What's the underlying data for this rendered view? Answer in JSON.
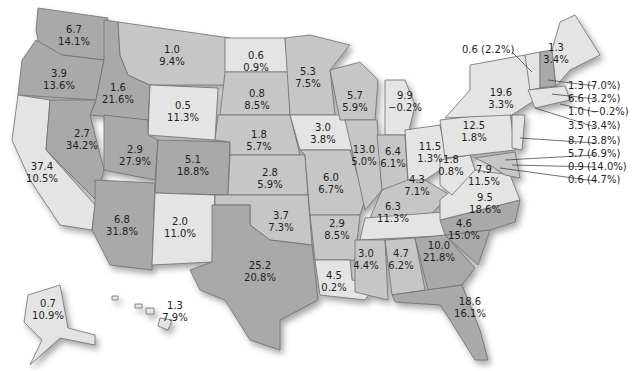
{
  "map": {
    "type": "choropleth",
    "region": "United States",
    "shading_levels": {
      "light": "#e4e4e4",
      "medium": "#c6c6c6",
      "dark": "#a9a9a9"
    },
    "label_format": "value / percent change",
    "states": {
      "WA": {
        "value": "6.7",
        "pct": "14.1%",
        "shade": "dark"
      },
      "OR": {
        "value": "3.9",
        "pct": "13.6%",
        "shade": "dark"
      },
      "CA": {
        "value": "37.4",
        "pct": "10.5%",
        "shade": "light"
      },
      "ID": {
        "value": "1.6",
        "pct": "21.6%",
        "shade": "dark"
      },
      "NV": {
        "value": "2.7",
        "pct": "34.2%",
        "shade": "dark"
      },
      "MT": {
        "value": "1.0",
        "pct": "9.4%",
        "shade": "mid"
      },
      "WY": {
        "value": "0.5",
        "pct": "11.3%",
        "shade": "light"
      },
      "UT": {
        "value": "2.9",
        "pct": "27.9%",
        "shade": "dark"
      },
      "AZ": {
        "value": "6.8",
        "pct": "31.8%",
        "shade": "dark"
      },
      "CO": {
        "value": "5.1",
        "pct": "18.8%",
        "shade": "dark"
      },
      "NM": {
        "value": "2.0",
        "pct": "11.0%",
        "shade": "light"
      },
      "ND": {
        "value": "0.6",
        "pct": "0.9%",
        "shade": "light"
      },
      "SD": {
        "value": "0.8",
        "pct": "8.5%",
        "shade": "mid"
      },
      "NE": {
        "value": "1.8",
        "pct": "5.7%",
        "shade": "mid"
      },
      "KS": {
        "value": "2.8",
        "pct": "5.9%",
        "shade": "mid"
      },
      "OK": {
        "value": "3.7",
        "pct": "7.3%",
        "shade": "mid"
      },
      "TX": {
        "value": "25.2",
        "pct": "20.8%",
        "shade": "dark"
      },
      "MN": {
        "value": "5.3",
        "pct": "7.5%",
        "shade": "mid"
      },
      "IA": {
        "value": "3.0",
        "pct": "3.8%",
        "shade": "light"
      },
      "MO": {
        "value": "6.0",
        "pct": "6.7%",
        "shade": "mid"
      },
      "AR": {
        "value": "2.9",
        "pct": "8.5%",
        "shade": "mid"
      },
      "LA": {
        "value": "4.5",
        "pct": "0.2%",
        "shade": "light"
      },
      "WI": {
        "value": "5.7",
        "pct": "5.9%",
        "shade": "mid"
      },
      "IL": {
        "value": "13.0",
        "pct": "5.0%",
        "shade": "mid"
      },
      "MI": {
        "value": "9.9",
        "pct": "−0.2%",
        "shade": "light"
      },
      "IN": {
        "value": "6.4",
        "pct": "6.1%",
        "shade": "mid"
      },
      "OH": {
        "value": "11.5",
        "pct": "1.3%",
        "shade": "light"
      },
      "KY": {
        "value": "4.3",
        "pct": "7.1%",
        "shade": "mid"
      },
      "TN": {
        "value": "6.3",
        "pct": "11.3%",
        "shade": "light"
      },
      "MS": {
        "value": "3.0",
        "pct": "4.4%",
        "shade": "mid"
      },
      "AL": {
        "value": "4.7",
        "pct": "6.2%",
        "shade": "mid"
      },
      "GA": {
        "value": "10.0",
        "pct": "21.8%",
        "shade": "dark"
      },
      "FL": {
        "value": "18.6",
        "pct": "16.1%",
        "shade": "dark"
      },
      "SC": {
        "value": "4.6",
        "pct": "15.0%",
        "shade": "dark"
      },
      "NC": {
        "value": "9.5",
        "pct": "18.6%",
        "shade": "dark"
      },
      "VA": {
        "value": "7.9",
        "pct": "11.5%",
        "shade": "light"
      },
      "WV": {
        "value": "1.8",
        "pct": "0.8%",
        "shade": "light"
      },
      "PA": {
        "value": "12.5",
        "pct": "1.8%",
        "shade": "light"
      },
      "NY": {
        "value": "19.6",
        "pct": "3.3%",
        "shade": "light"
      },
      "ME": {
        "value": "1.3",
        "pct": "3.4%",
        "shade": "light"
      },
      "AK": {
        "value": "0.7",
        "pct": "10.9%",
        "shade": "light"
      },
      "HI": {
        "value": "1.3",
        "pct": "7.9%",
        "shade": "light"
      }
    },
    "callouts": [
      {
        "state": "VT",
        "text": "0.6 (2.2%)"
      },
      {
        "state": "NH",
        "text": "1.3 (7.0%)"
      },
      {
        "state": "MA",
        "text": "6.6 (3.2%)"
      },
      {
        "state": "RI",
        "text": "1.0 (−0.2%)"
      },
      {
        "state": "CT",
        "text": "3.5 (3.4%)"
      },
      {
        "state": "NJ",
        "text": "8.7 (3.8%)"
      },
      {
        "state": "MD",
        "text": "5.7 (6.9%)"
      },
      {
        "state": "DE",
        "text": "0.9 (14.0%)"
      },
      {
        "state": "DC",
        "text": "0.6 (4.7%)"
      }
    ]
  }
}
